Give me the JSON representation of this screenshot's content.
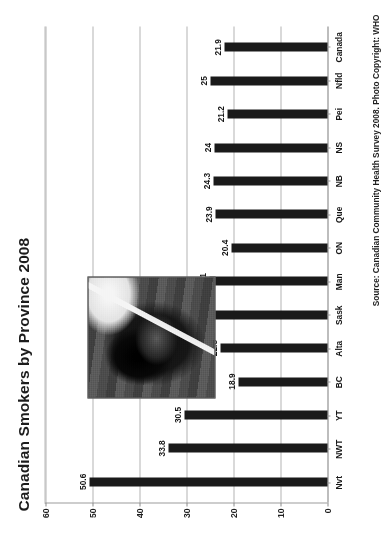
{
  "chart_data": {
    "type": "bar",
    "title": "Canadian Smokers by Province 2008",
    "xlabel": "",
    "ylabel": "",
    "ylim": [
      0,
      60
    ],
    "yticks": [
      0,
      10,
      20,
      30,
      40,
      50,
      60
    ],
    "grid": true,
    "legend": null,
    "orientation": "vertical-bars-page-rotated-90ccw",
    "bar_color": "#1a1a1a",
    "categories": [
      "Nvt",
      "NWT",
      "YT",
      "BC",
      "Alta",
      "Sask",
      "Man",
      "ON",
      "Que",
      "NB",
      "NS",
      "Pei",
      "Nfld",
      "Canada"
    ],
    "values": [
      50.6,
      33.8,
      30.5,
      18.9,
      22.8,
      25.5,
      25.1,
      20.4,
      23.9,
      24.3,
      24,
      21.2,
      25,
      21.9
    ],
    "value_labels": [
      "50.6",
      "33.8",
      "30.5",
      "18.9",
      "22.8",
      "25.5",
      "25.1",
      "20.4",
      "23.9",
      "24.3",
      "24",
      "21.2",
      "25",
      "21.9"
    ],
    "annotations": [
      {
        "name": "photo",
        "type": "image",
        "description": "grayscale photo of a person lying down smoking a cigarette"
      }
    ]
  },
  "figure": {
    "title": "Canadian Smokers by Province 2008",
    "source_note": "Source: Canadian Community Health Survey 2008. Photo Copyright: WHO"
  },
  "axis": {
    "y_tick_labels": [
      "0",
      "10",
      "20",
      "30",
      "40",
      "50",
      "60"
    ]
  },
  "photo": {
    "alt": "smoker-photograph"
  }
}
